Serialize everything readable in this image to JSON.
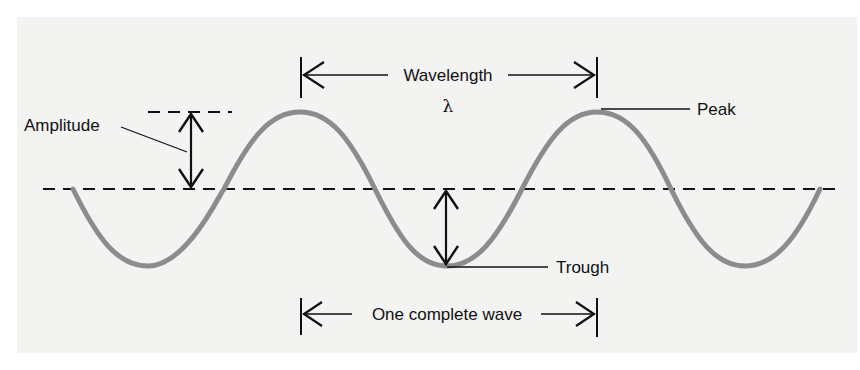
{
  "diagram": {
    "colors": {
      "background": "#ffffff",
      "panel": "#f3f3f2",
      "wave": "#8c8c8c",
      "ink": "#111111"
    },
    "labels": {
      "wavelength": "Wavelength",
      "lambda": "λ",
      "peak": "Peak",
      "amplitude": "Amplitude",
      "trough": "Trough",
      "one_complete_wave": "One complete wave"
    },
    "wave": {
      "start_x": 73,
      "end_x": 820,
      "midline_y": 189,
      "amplitude_px": 77,
      "period_px": 298,
      "peaks_x": [
        300,
        597
      ],
      "troughs_x": [
        148,
        447,
        745
      ]
    }
  }
}
